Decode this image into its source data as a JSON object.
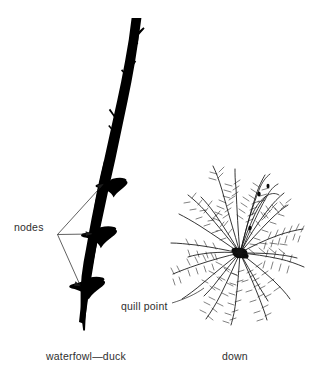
{
  "figure": {
    "background_color": "#ffffff",
    "ink_color": "#000000",
    "text_color": "#2e2e2e",
    "width": 323,
    "height": 380
  },
  "labels": {
    "nodes": "nodes",
    "quill_point": "quill point",
    "waterfowl_duck": "waterfowl—duck",
    "down": "down"
  },
  "specimens": [
    {
      "name": "waterfowl-duck-feather",
      "caption": "waterfowl—duck",
      "description": "Dark tapering feather shaft with three swollen nodes and small barb stubs along the upper shaft",
      "node_count": 3
    },
    {
      "name": "down-feather",
      "caption": "down",
      "description": "Radial burst of plumulaceous barbs with fine barbules emanating from a dark central quill point",
      "quill_point_label": "quill point"
    }
  ],
  "annotations": [
    {
      "name": "nodes-leader",
      "label": "nodes",
      "arrow_count": 3,
      "points_to": "three shaft nodes"
    },
    {
      "name": "quill-point-leader",
      "label": "quill point",
      "arrow_count": 1,
      "points_to": "center of down feather"
    }
  ]
}
